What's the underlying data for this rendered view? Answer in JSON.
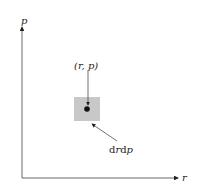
{
  "axes": {
    "y_label": "p",
    "x_label": "r"
  },
  "point": {
    "label": "(r, p)"
  },
  "element": {
    "label": "drdp",
    "label_d1": "d",
    "label_r": "r",
    "label_d2": "d",
    "label_p": "p"
  },
  "colors": {
    "element_fill": "#c8c8c8",
    "ink": "#222222"
  }
}
